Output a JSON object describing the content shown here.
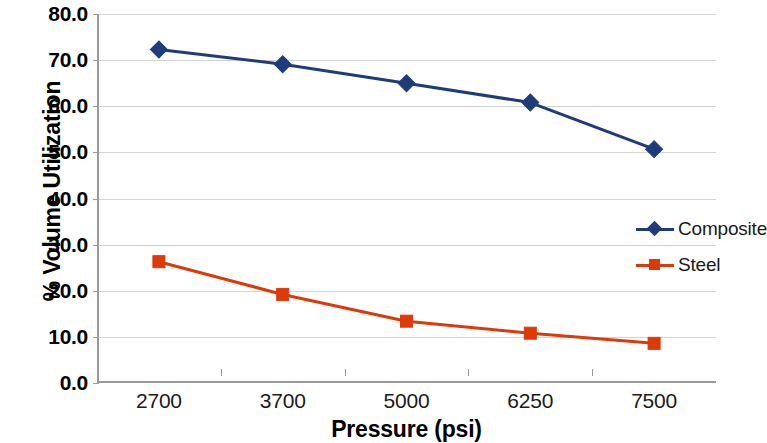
{
  "chart_data": {
    "type": "line",
    "title": "",
    "xlabel": "Pressure (psi)",
    "ylabel": "% Volume Utilization",
    "categories": [
      "2700",
      "3700",
      "5000",
      "6250",
      "7500"
    ],
    "ylim": [
      0.0,
      80.0
    ],
    "y_ticks": [
      "0.0",
      "10.0",
      "20.0",
      "30.0",
      "40.0",
      "50.0",
      "60.0",
      "70.0",
      "80.0"
    ],
    "y_tick_values": [
      0.0,
      10.0,
      20.0,
      30.0,
      40.0,
      50.0,
      60.0,
      70.0,
      80.0
    ],
    "grid": true,
    "legend_position": "right",
    "series": [
      {
        "name": "Composite",
        "color": "#1F3C7A",
        "marker": "diamond",
        "values": [
          72.3,
          69.1,
          65.0,
          60.8,
          50.7
        ]
      },
      {
        "name": "Steel",
        "color": "#DD3A0A",
        "marker": "square",
        "values": [
          26.3,
          19.2,
          13.4,
          10.8,
          8.6
        ]
      }
    ]
  },
  "axes": {
    "y_title": "% Volume Utilization",
    "x_title": "Pressure (psi)"
  },
  "colors": {
    "composite": "#1F3C7A",
    "steel": "#DD3A0A",
    "grid": "#d4d4d4",
    "axis": "#9a9a9a",
    "text": "#000000"
  },
  "legend": {
    "items": [
      {
        "label": "Composite",
        "color": "#1F3C7A",
        "marker": "diamond"
      },
      {
        "label": "Steel",
        "color": "#DD3A0A",
        "marker": "square"
      }
    ]
  }
}
